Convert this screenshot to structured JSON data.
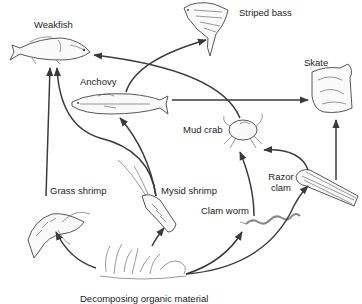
{
  "diagram": {
    "type": "food-web",
    "colors": {
      "background": "#ffffff",
      "arrow": "#3a3a3a",
      "text": "#1e1e1e"
    },
    "organisms": {
      "weakfish": "Weakfish",
      "striped_bass": "Striped bass",
      "skate": "Skate",
      "anchovy": "Anchovy",
      "mud_crab": "Mud crab",
      "razor_clam_line1": "Razor",
      "razor_clam_line2": "clam",
      "grass_shrimp": "Grass shrimp",
      "mysid_shrimp": "Mysid shrimp",
      "clam_worm": "Clam worm",
      "detritus": "Decomposing organic material"
    },
    "edges": [
      {
        "from": "Decomposing organic material",
        "to": "Grass shrimp"
      },
      {
        "from": "Decomposing organic material",
        "to": "Mysid shrimp"
      },
      {
        "from": "Decomposing organic material",
        "to": "Clam worm"
      },
      {
        "from": "Decomposing organic material",
        "to": "Razor clam"
      },
      {
        "from": "Grass shrimp",
        "to": "Weakfish"
      },
      {
        "from": "Mysid shrimp",
        "to": "Weakfish"
      },
      {
        "from": "Mysid shrimp",
        "to": "Anchovy"
      },
      {
        "from": "Anchovy",
        "to": "Striped bass"
      },
      {
        "from": "Anchovy",
        "to": "Skate"
      },
      {
        "from": "Mud crab",
        "to": "Weakfish"
      },
      {
        "from": "Clam worm",
        "to": "Mud crab"
      },
      {
        "from": "Razor clam",
        "to": "Mud crab"
      },
      {
        "from": "Razor clam",
        "to": "Skate"
      }
    ]
  }
}
